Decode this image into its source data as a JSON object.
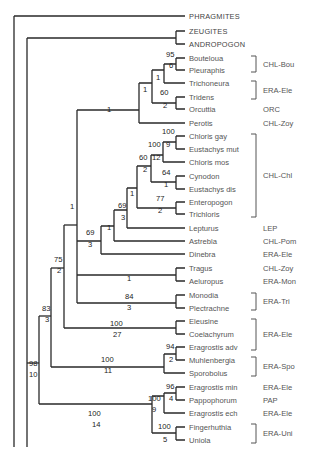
{
  "figure": {
    "type": "phylogenetic-tree",
    "colors": {
      "branch": "#2a2a2a",
      "text": "#555555",
      "support": "#222222",
      "background": "#ffffff"
    }
  },
  "leaves": [
    {
      "name": "PHRAGMITES",
      "y": 16,
      "outgroup": true,
      "group": ""
    },
    {
      "name": "ZEUGITES",
      "y": 31,
      "outgroup": true,
      "group": ""
    },
    {
      "name": "ANDROPOGON",
      "y": 44,
      "outgroup": true,
      "group": ""
    },
    {
      "name": "Bouteloua",
      "y": 58,
      "group": "CHL-Bou"
    },
    {
      "name": "Pleuraphis",
      "y": 70,
      "group": "CHL-Bou"
    },
    {
      "name": "Trichoneura",
      "y": 83,
      "group": "ERA-Ele"
    },
    {
      "name": "Tridens",
      "y": 97,
      "group": "ERA-Ele"
    },
    {
      "name": "Orcuttia",
      "y": 109,
      "group": "ORC"
    },
    {
      "name": "Perotis",
      "y": 123,
      "group": "CHL-Zoy"
    },
    {
      "name": "Chloris gay",
      "y": 136,
      "group": "CHL-Chl"
    },
    {
      "name": "Eustachys mut",
      "y": 149,
      "group": "CHL-Chl"
    },
    {
      "name": "Chloris mos",
      "y": 162,
      "group": "CHL-Chl"
    },
    {
      "name": "Cynodon",
      "y": 176,
      "group": "CHL-Chl"
    },
    {
      "name": "Eustachys dis",
      "y": 189,
      "group": "CHL-Chl"
    },
    {
      "name": "Enteropogon",
      "y": 202,
      "group": "CHL-Chl"
    },
    {
      "name": "Trichloris",
      "y": 214,
      "group": "CHL-Chl"
    },
    {
      "name": "Lepturus",
      "y": 228,
      "group": "LEP"
    },
    {
      "name": "Astrebla",
      "y": 241,
      "group": "CHL-Pom"
    },
    {
      "name": "Dinebra",
      "y": 254,
      "group": "ERA-Ele"
    },
    {
      "name": "Tragus",
      "y": 268,
      "group": "CHL-Zoy"
    },
    {
      "name": "Aeluropus",
      "y": 281,
      "group": "ERA-Mon"
    },
    {
      "name": "Monodia",
      "y": 295,
      "group": "ERA-Tri"
    },
    {
      "name": "Plectrachne",
      "y": 308,
      "group": "ERA-Tri"
    },
    {
      "name": "Eleusine",
      "y": 321,
      "group": "ERA-Ele"
    },
    {
      "name": "Coelachyrum",
      "y": 334,
      "group": "ERA-Ele"
    },
    {
      "name": "Eragrostis adv",
      "y": 347,
      "group": "ERA-Ele"
    },
    {
      "name": "Muhlenbergia",
      "y": 360,
      "group": "ERA-Spo"
    },
    {
      "name": "Sporobolus",
      "y": 373,
      "group": "ERA-Spo"
    },
    {
      "name": "Eragrostis min",
      "y": 387,
      "group": "ERA-Ele"
    },
    {
      "name": "Pappophorum",
      "y": 400,
      "group": "PAP"
    },
    {
      "name": "Eragrostis ech",
      "y": 413,
      "group": "ERA-Ele"
    },
    {
      "name": "Fingerhuthia",
      "y": 427,
      "group": "ERA-Uni"
    },
    {
      "name": "Uniola",
      "y": 440,
      "group": "ERA-Uni"
    }
  ],
  "group_labels": [
    {
      "label": "CHL-Bou",
      "y": 64,
      "bracket": [
        56,
        72
      ]
    },
    {
      "label": "ERA-Ele",
      "y": 90,
      "bracket": [
        81,
        99
      ]
    },
    {
      "label": "ORC",
      "y": 109
    },
    {
      "label": "CHL-Zoy",
      "y": 123
    },
    {
      "label": "CHL-Chl",
      "y": 175,
      "bracket": [
        134,
        217
      ]
    },
    {
      "label": "LEP",
      "y": 228
    },
    {
      "label": "CHL-Pom",
      "y": 241
    },
    {
      "label": "ERA-Ele",
      "y": 254
    },
    {
      "label": "CHL-Zoy",
      "y": 268
    },
    {
      "label": "ERA-Mon",
      "y": 281
    },
    {
      "label": "ERA-Tri",
      "y": 301,
      "bracket": [
        293,
        310
      ]
    },
    {
      "label": "ERA-Ele",
      "y": 334,
      "bracket": [
        319,
        350
      ]
    },
    {
      "label": "ERA-Spo",
      "y": 366,
      "bracket": [
        357,
        376
      ]
    },
    {
      "label": "ERA-Ele",
      "y": 387
    },
    {
      "label": "PAP",
      "y": 400
    },
    {
      "label": "ERA-Ele",
      "y": 413
    },
    {
      "label": "ERA-Uni",
      "y": 433,
      "bracket": [
        424,
        443
      ]
    }
  ],
  "branches": [
    {
      "d": "M14 16 H185"
    },
    {
      "d": "M14 16 V447 H27"
    },
    {
      "d": "M27 38 V447"
    },
    {
      "d": "M27 38 H176"
    },
    {
      "d": "M176 31 V44"
    },
    {
      "d": "M176 31 H185"
    },
    {
      "d": "M176 44 H185"
    },
    {
      "d": "M27 367 H39"
    },
    {
      "d": "M39 138 V367"
    },
    {
      "d": "M39 138 H27"
    },
    {
      "d": "M39 97 H27"
    },
    {
      "d": "M39 97 V138"
    },
    {
      "d": "M38 97 H39"
    },
    {
      "d": "M27 367 V97"
    },
    {
      "d": "M39 97 H51"
    },
    {
      "d": "M51 84 V323"
    },
    {
      "d": "M51 84 H64"
    },
    {
      "d": "M64 24 V300"
    },
    {
      "d": "M64 24 H78"
    },
    {
      "d": "M78 65 V240"
    },
    {
      "d": "M78 65 H139"
    },
    {
      "d": "M139 49 V83"
    },
    {
      "d": "M139 49 H153"
    },
    {
      "d": "M153 37 V61"
    },
    {
      "d": "M153 37 H165"
    },
    {
      "d": "M165 27 V44"
    },
    {
      "d": "M165 27 H177"
    },
    {
      "d": "M177 19 V23"
    },
    {
      "d": "M139 83 H185"
    }
  ],
  "support_values": [
    {
      "text": "95",
      "x": 166,
      "y": 57
    },
    {
      "text": "6",
      "x": 169,
      "y": 68
    },
    {
      "text": "1",
      "x": 156,
      "y": 80
    },
    {
      "text": "1",
      "x": 143,
      "y": 92
    },
    {
      "text": "60",
      "x": 160,
      "y": 95
    },
    {
      "text": "2",
      "x": 163,
      "y": 108
    },
    {
      "text": "1",
      "x": 107,
      "y": 112
    },
    {
      "text": "100",
      "x": 162,
      "y": 134
    },
    {
      "text": "9",
      "x": 166,
      "y": 147
    },
    {
      "text": "100",
      "x": 148,
      "y": 147
    },
    {
      "text": "12",
      "x": 152,
      "y": 160
    },
    {
      "text": "60",
      "x": 139,
      "y": 160
    },
    {
      "text": "2",
      "x": 143,
      "y": 172
    },
    {
      "text": "64",
      "x": 162,
      "y": 175
    },
    {
      "text": "1",
      "x": 164,
      "y": 187
    },
    {
      "text": "1",
      "x": 130,
      "y": 196
    },
    {
      "text": "77",
      "x": 156,
      "y": 201
    },
    {
      "text": "2",
      "x": 158,
      "y": 213
    },
    {
      "text": "69",
      "x": 118,
      "y": 208
    },
    {
      "text": "3",
      "x": 121,
      "y": 220
    },
    {
      "text": "1",
      "x": 107,
      "y": 230
    },
    {
      "text": "69",
      "x": 86,
      "y": 235
    },
    {
      "text": "3",
      "x": 88,
      "y": 247
    },
    {
      "text": "1",
      "x": 70,
      "y": 209
    },
    {
      "text": "1",
      "x": 127,
      "y": 281
    },
    {
      "text": "84",
      "x": 125,
      "y": 299
    },
    {
      "text": "3",
      "x": 127,
      "y": 310
    },
    {
      "text": "75",
      "x": 54,
      "y": 262
    },
    {
      "text": "2",
      "x": 57,
      "y": 273
    },
    {
      "text": "100",
      "x": 110,
      "y": 326
    },
    {
      "text": "27",
      "x": 113,
      "y": 337
    },
    {
      "text": "83",
      "x": 42,
      "y": 311
    },
    {
      "text": "3",
      "x": 45,
      "y": 322
    },
    {
      "text": "94",
      "x": 166,
      "y": 349
    },
    {
      "text": "2",
      "x": 169,
      "y": 362
    },
    {
      "text": "100",
      "x": 101,
      "y": 362
    },
    {
      "text": "11",
      "x": 104,
      "y": 373
    },
    {
      "text": "98",
      "x": 29,
      "y": 366
    },
    {
      "text": "10",
      "x": 29,
      "y": 377
    },
    {
      "text": "96",
      "x": 166,
      "y": 389
    },
    {
      "text": "4",
      "x": 169,
      "y": 401
    },
    {
      "text": "100",
      "x": 148,
      "y": 401
    },
    {
      "text": "9",
      "x": 152,
      "y": 412
    },
    {
      "text": "100",
      "x": 88,
      "y": 416
    },
    {
      "text": "14",
      "x": 92,
      "y": 427
    },
    {
      "text": "100",
      "x": 158,
      "y": 429
    },
    {
      "text": "5",
      "x": 163,
      "y": 442
    }
  ]
}
